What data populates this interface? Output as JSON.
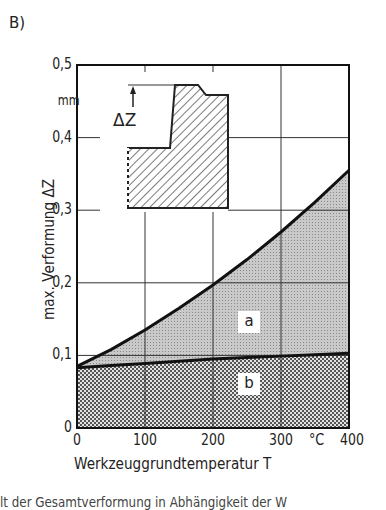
{
  "panel_label": "B)",
  "inset": {
    "dimension_label": "ΔZ"
  },
  "regions": {
    "a": "a",
    "b": "b"
  },
  "footer_partial": "lt der Gesamtverformung in Abhängigkeit der W",
  "chart_data": {
    "type": "area",
    "title": "",
    "xlabel": "Werkzeuggrundtemperatur T",
    "xunit": "°C",
    "ylabel": "max. Verformung ΔZ",
    "yunit": "mm",
    "xlim": [
      0,
      400
    ],
    "ylim": [
      0,
      0.5
    ],
    "x_ticks": [
      "0",
      "100",
      "200",
      "300",
      "400"
    ],
    "y_ticks": [
      "0",
      "0,1",
      "0,2",
      "0,3",
      "0,4",
      "0,5"
    ],
    "grid": true,
    "x": [
      0,
      50,
      100,
      150,
      200,
      250,
      300,
      350,
      400
    ],
    "series": [
      {
        "name": "a",
        "label": "upper boundary (total deformation)",
        "values": [
          0.085,
          0.108,
          0.135,
          0.165,
          0.197,
          0.232,
          0.27,
          0.311,
          0.355
        ],
        "fill": "light stipple"
      },
      {
        "name": "b",
        "label": "lower boundary",
        "values": [
          0.083,
          0.086,
          0.089,
          0.092,
          0.095,
          0.097,
          0.099,
          0.101,
          0.103
        ],
        "fill": "dark checker"
      }
    ],
    "annotations": [
      {
        "text": "a",
        "x": 255,
        "y": 0.145
      },
      {
        "text": "b",
        "x": 255,
        "y": 0.06
      },
      {
        "text": "ΔZ",
        "type": "inset-sketch"
      }
    ]
  }
}
